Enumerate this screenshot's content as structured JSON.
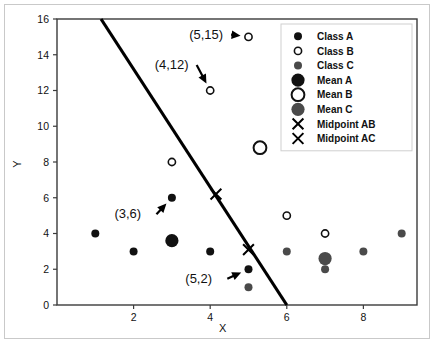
{
  "chart_data": {
    "type": "scatter",
    "title": "",
    "xlabel": "X",
    "ylabel": "Y",
    "xlim": [
      0.0,
      9.4
    ],
    "ylim": [
      0,
      16
    ],
    "xticks": [
      2,
      4,
      6,
      8
    ],
    "yticks": [
      0,
      2,
      4,
      6,
      8,
      10,
      12,
      14,
      16
    ],
    "grid": false,
    "legend_position": "upper right",
    "series": [
      {
        "name": "Class A",
        "marker": "filled-circle-small",
        "color": "#111111",
        "points": [
          [
            1,
            4
          ],
          [
            2,
            3
          ],
          [
            3,
            6
          ],
          [
            4,
            3
          ],
          [
            5,
            2
          ]
        ]
      },
      {
        "name": "Class B",
        "marker": "open-circle-small",
        "color": "#111111",
        "points": [
          [
            3,
            8
          ],
          [
            4,
            12
          ],
          [
            5,
            15
          ],
          [
            6,
            5
          ],
          [
            7,
            4
          ]
        ]
      },
      {
        "name": "Class C",
        "marker": "filled-circle-gray",
        "color": "#4a4a4a",
        "points": [
          [
            5,
            1
          ],
          [
            6,
            3
          ],
          [
            7,
            2
          ],
          [
            8,
            3
          ],
          [
            9,
            4
          ]
        ]
      },
      {
        "name": "Mean A",
        "marker": "filled-circle-large",
        "color": "#111111",
        "points": [
          [
            3.0,
            3.6
          ]
        ]
      },
      {
        "name": "Mean B",
        "marker": "open-circle-large",
        "color": "#111111",
        "points": [
          [
            5.3,
            8.8
          ]
        ]
      },
      {
        "name": "Mean C",
        "marker": "filled-circle-large-gray",
        "color": "#4a4a4a",
        "points": [
          [
            7.0,
            2.6
          ]
        ]
      },
      {
        "name": "Midpoint AB",
        "marker": "x-cross",
        "color": "#000000",
        "points": [
          [
            4.15,
            6.2
          ]
        ]
      },
      {
        "name": "Midpoint AC",
        "marker": "x-cross",
        "color": "#000000",
        "points": [
          [
            5.0,
            3.1
          ]
        ]
      }
    ],
    "boundary_line": {
      "label": "decision boundary",
      "from": [
        1.15,
        16
      ],
      "to": [
        6.0,
        0
      ],
      "color": "#000000"
    },
    "annotations": [
      {
        "text": "(5,15)",
        "text_xy": [
          3.45,
          14.9
        ],
        "target_xy": [
          5.0,
          15.0
        ]
      },
      {
        "text": "(4,12)",
        "text_xy": [
          2.55,
          13.2
        ],
        "target_xy": [
          4.0,
          12.0
        ]
      },
      {
        "text": "(3,6)",
        "text_xy": [
          1.5,
          4.85
        ],
        "target_xy": [
          3.0,
          6.0
        ]
      },
      {
        "text": "(5,2)",
        "text_xy": [
          3.35,
          1.25
        ],
        "target_xy": [
          5.0,
          2.0
        ]
      }
    ]
  },
  "legend": {
    "entries": [
      {
        "label": "Class A",
        "marker": "filled-circle-small"
      },
      {
        "label": "Class B",
        "marker": "open-circle-small"
      },
      {
        "label": "Class C",
        "marker": "filled-circle-gray"
      },
      {
        "label": "Mean A",
        "marker": "filled-circle-large"
      },
      {
        "label": "Mean B",
        "marker": "open-circle-large"
      },
      {
        "label": "Mean C",
        "marker": "filled-circle-large-gray"
      },
      {
        "label": "Midpoint AB",
        "marker": "x-cross"
      },
      {
        "label": "Midpoint AC",
        "marker": "x-cross"
      }
    ]
  },
  "axes": {
    "x_title": "X",
    "y_title": "Y",
    "x_tick_labels": [
      "2",
      "4",
      "6",
      "8"
    ],
    "y_tick_labels": [
      "0",
      "2",
      "4",
      "6",
      "8",
      "10",
      "12",
      "14",
      "16"
    ]
  }
}
